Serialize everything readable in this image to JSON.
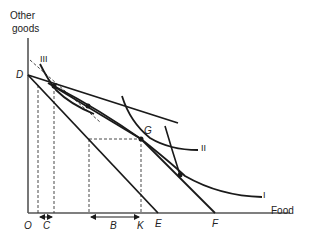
{
  "diagram": {
    "type": "indifference-curve-budget-constraint",
    "axes": {
      "y_label_line1": "Other",
      "y_label_line2": "goods",
      "x_label": "Food",
      "origin": "O"
    },
    "curve_labels": {
      "I": "I",
      "II": "II",
      "III": "III"
    },
    "point_labels": {
      "D": "D",
      "E": "E",
      "F": "F",
      "G": "G"
    },
    "axis_markers": {
      "C": "C",
      "B": "B",
      "K": "K"
    },
    "colors": {
      "line": "#1a1a1a",
      "dashed": "#333333",
      "background": "#ffffff"
    }
  }
}
